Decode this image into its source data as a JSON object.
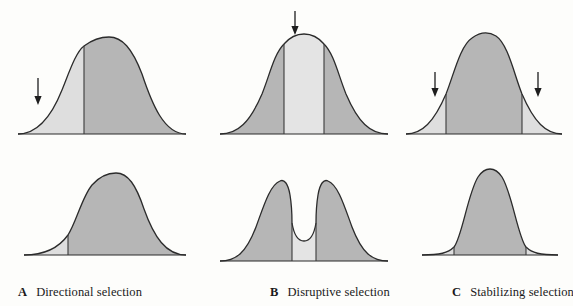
{
  "figure": {
    "background_color": "#fdfdfb",
    "panel_count": 3,
    "rows": 2
  },
  "style": {
    "dark_fill": "#b6b6b6",
    "light_fill": "#dedede",
    "stroke": "#2b2b2b",
    "divider_stroke": "#3a3a3a",
    "arrow_color": "#1e1e1e",
    "caption_color": "#1a1a1a"
  },
  "panels": [
    {
      "letter": "A",
      "label": "Directional selection",
      "caption_x": 18,
      "mode": "directional",
      "arrows": [
        {
          "x": 38,
          "y_top": 78,
          "y_bottom": 104
        }
      ],
      "before": {
        "shape": "unimodal-bell",
        "dividers": [
          0.36
        ],
        "shaded_light_regions": [
          "left-tail"
        ],
        "description": "Symmetric bell curve; left tail light-shaded indicating selected-against phenotypes"
      },
      "after": {
        "shape": "unimodal-bell-shifted-right",
        "dividers": [
          0.22
        ],
        "shaded_light_regions": [
          "left-sliver"
        ],
        "description": "Distribution shifted toward the right; mean moved away from the selected-against tail"
      }
    },
    {
      "letter": "B",
      "label": "Disruptive selection",
      "caption_x": 270,
      "mode": "disruptive",
      "arrows": [
        {
          "x": 295,
          "y_top": 10,
          "y_bottom": 36
        }
      ],
      "before": {
        "shape": "unimodal-bell",
        "dividers": [
          0.4,
          0.62
        ],
        "shaded_light_regions": [
          "center"
        ],
        "description": "Symmetric bell curve; central band light-shaded indicating selection against intermediates"
      },
      "after": {
        "shape": "bimodal-two-peaks",
        "dividers": [
          0.4,
          0.62
        ],
        "shaded_light_regions": [
          "center-valley"
        ],
        "description": "Bimodal distribution with two peaks separated by a deep central valley"
      }
    },
    {
      "letter": "C",
      "label": "Stabilizing selection",
      "caption_x": 452,
      "mode": "stabilizing",
      "arrows": [
        {
          "x": 435,
          "y_top": 72,
          "y_bottom": 98
        },
        {
          "x": 538,
          "y_top": 72,
          "y_bottom": 98
        }
      ],
      "before": {
        "shape": "unimodal-bell",
        "dividers": [
          0.28,
          0.72
        ],
        "shaded_light_regions": [
          "left-tail",
          "right-tail"
        ],
        "description": "Symmetric bell curve; both tails light-shaded indicating selection against extremes"
      },
      "after": {
        "shape": "unimodal-narrow-tall",
        "dividers": [
          0.3,
          0.7
        ],
        "shaded_light_regions": [
          "left-sliver",
          "right-sliver"
        ],
        "description": "Narrow, tall distribution with reduced variance around the mean"
      }
    }
  ]
}
